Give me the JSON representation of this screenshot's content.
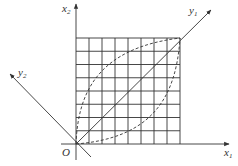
{
  "diagram": {
    "origin_label": "O",
    "axes": {
      "x1": {
        "label": "x",
        "subscript": "1"
      },
      "x2": {
        "label": "x",
        "subscript": "2"
      },
      "y1": {
        "label": "y",
        "subscript": "1"
      },
      "y2": {
        "label": "y",
        "subscript": "2"
      }
    },
    "grid": {
      "columns": 8,
      "rows": 8
    },
    "curves": [
      {
        "name": "upper-left-dashed-curve",
        "style": "dashed"
      },
      {
        "name": "lower-right-dashed-curve",
        "style": "dashed"
      }
    ],
    "colors": {
      "line": "#333333",
      "grid": "#333333",
      "background": "#ffffff"
    }
  }
}
